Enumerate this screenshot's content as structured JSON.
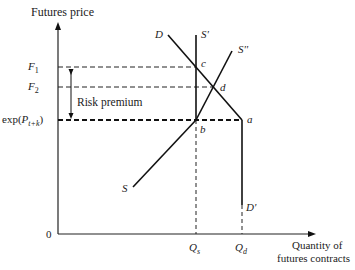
{
  "diagram": {
    "y_axis_label": "Futures price",
    "x_axis_label_line1": "Quantity of",
    "x_axis_label_line2": "futures contracts",
    "origin_label": "0",
    "price_levels": [
      {
        "name": "F1",
        "symbol": "F",
        "sub": "1"
      },
      {
        "name": "F2",
        "symbol": "F",
        "sub": "2"
      },
      {
        "name": "exp(P_{t+k})",
        "prefix": "exp(",
        "symbol": "P",
        "sub": "t+k",
        "suffix": ")"
      }
    ],
    "risk_premium_label": "Risk premium",
    "quantities": [
      {
        "name": "Qs",
        "symbol": "Q",
        "sub": "s"
      },
      {
        "name": "Qd",
        "symbol": "Q",
        "sub": "d"
      }
    ],
    "curves": [
      {
        "label": "D",
        "type": "demand"
      },
      {
        "label": "D'",
        "type": "demand-vertical"
      },
      {
        "label": "S'",
        "type": "supply-vertical"
      },
      {
        "label": "S''",
        "type": "supply-upward"
      },
      {
        "label": "S",
        "type": "supply-lower-end"
      }
    ],
    "points": [
      {
        "label": "a"
      },
      {
        "label": "b"
      },
      {
        "label": "c"
      },
      {
        "label": "d"
      }
    ]
  }
}
